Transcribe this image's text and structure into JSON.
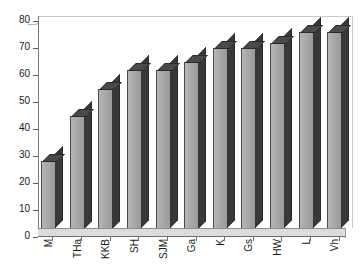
{
  "chart_data": {
    "type": "bar",
    "title": "",
    "subtitle": "",
    "xlabel": "",
    "ylabel": "",
    "categories": [
      "M",
      "THa",
      "KKB",
      "SH",
      "SJM",
      "Ga",
      "K",
      "Gs",
      "HW",
      "L",
      "Vh"
    ],
    "values": [
      28,
      45,
      55,
      62,
      62,
      65,
      70,
      70,
      72,
      76,
      76
    ],
    "ylim": [
      0,
      80
    ],
    "ytick_labels": [
      "0",
      "10",
      "20",
      "30",
      "40",
      "50",
      "60",
      "70",
      "80"
    ],
    "ytick_values": [
      0,
      10,
      20,
      30,
      40,
      50,
      60,
      70,
      80
    ],
    "grid": false,
    "legend": false,
    "legend_position": "none",
    "style": "3d-column",
    "series": [
      {
        "name": "Series 1",
        "values": [
          28,
          45,
          55,
          62,
          62,
          65,
          70,
          70,
          72,
          76,
          76
        ]
      }
    ],
    "colors": {
      "bar_front": "#a8a8a8",
      "bar_side": "#383838",
      "bar_top": "#4a4a4a",
      "bar_outline": "#4a4a4a",
      "plot_background": "#ffffff",
      "floor": "#dcdcdc",
      "axis": "#5a5a5a",
      "frame": "#c9c9c9",
      "text": "#1a1a1a"
    }
  }
}
